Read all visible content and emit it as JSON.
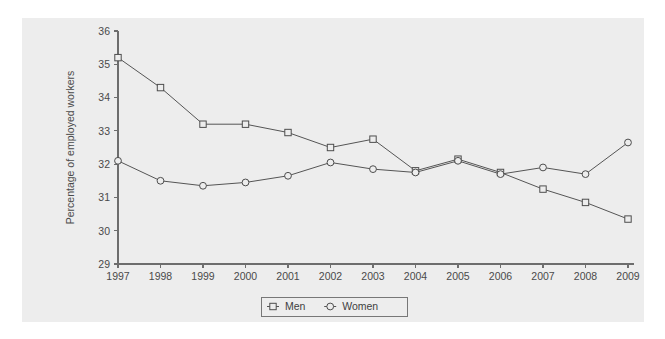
{
  "chart_data": {
    "type": "line",
    "title": "",
    "subtitle": "",
    "xlabel": "",
    "ylabel": "Percentage of employed workers",
    "categories": [
      "1997",
      "1998",
      "1999",
      "2000",
      "2001",
      "2002",
      "2003",
      "2004",
      "2005",
      "2006",
      "2007",
      "2008",
      "2009"
    ],
    "x": [
      1997,
      1998,
      1999,
      2000,
      2001,
      2002,
      2003,
      2004,
      2005,
      2006,
      2007,
      2008,
      2009
    ],
    "xlim": [
      1997,
      2009
    ],
    "ylim": [
      29,
      36
    ],
    "yticks": [
      29,
      30,
      31,
      32,
      33,
      34,
      35,
      36
    ],
    "ytick_labels": [
      "29",
      "30",
      "31",
      "32",
      "33",
      "34",
      "35",
      "36"
    ],
    "grid": false,
    "legend_position": "bottom-center",
    "series": [
      {
        "name": "Men",
        "marker": "square",
        "values": [
          35.2,
          34.3,
          33.2,
          33.2,
          32.95,
          32.5,
          32.75,
          31.8,
          32.15,
          31.75,
          31.25,
          30.85,
          30.35
        ]
      },
      {
        "name": "Women",
        "marker": "circle",
        "values": [
          32.1,
          31.5,
          31.35,
          31.45,
          31.65,
          32.05,
          31.85,
          31.75,
          32.1,
          31.7,
          31.9,
          31.7,
          32.65
        ]
      }
    ],
    "colors": {
      "line": "#555555",
      "marker_stroke": "#4d4d4d",
      "marker_fill": "#ededed",
      "axis": "#6d6d6d",
      "panel_background": "#ededed",
      "figure_background": "#ffffff",
      "text": "#4a4a4a"
    }
  },
  "legend": {
    "items": [
      {
        "label": "Men",
        "marker": "square"
      },
      {
        "label": "Women",
        "marker": "circle"
      }
    ]
  }
}
